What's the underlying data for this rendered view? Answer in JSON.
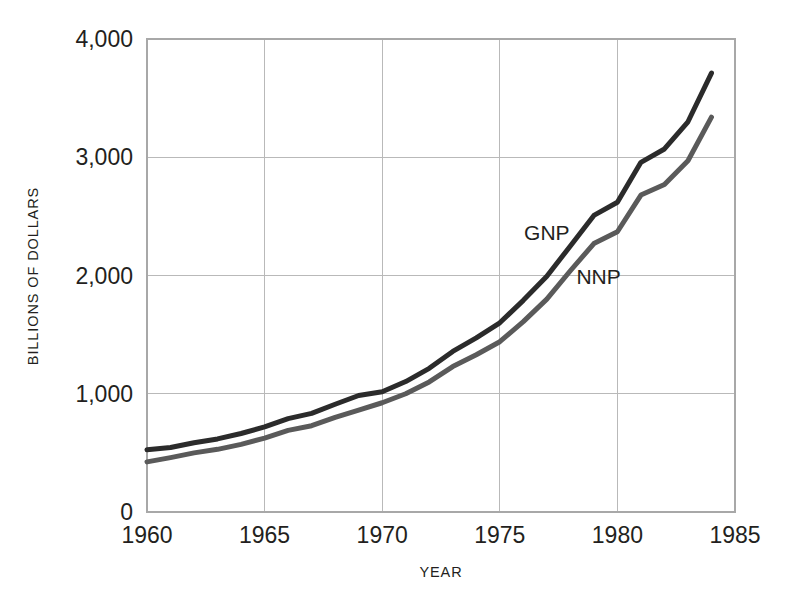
{
  "chart_data": {
    "type": "line",
    "title": "",
    "xlabel": "YEAR",
    "ylabel": "BILLIONS OF DOLLARS",
    "xlim": [
      1960,
      1985
    ],
    "ylim": [
      0,
      4000
    ],
    "xticks": [
      1960,
      1965,
      1970,
      1975,
      1980,
      1985
    ],
    "xtick_labels": [
      "1960",
      "1965",
      "1970",
      "1975",
      "1980",
      "1985"
    ],
    "yticks": [
      0,
      1000,
      2000,
      3000,
      4000
    ],
    "ytick_labels": [
      "0",
      "1,000",
      "2,000",
      "3,000",
      "4,000"
    ],
    "grid": true,
    "legend_position": "inline-annotation",
    "x": [
      1960,
      1961,
      1962,
      1963,
      1964,
      1965,
      1966,
      1967,
      1968,
      1969,
      1970,
      1971,
      1972,
      1973,
      1974,
      1975,
      1976,
      1977,
      1978,
      1979,
      1980,
      1981,
      1982,
      1983,
      1984
    ],
    "series": [
      {
        "name": "GNP",
        "color": "#2b2b2b",
        "line_width": 5,
        "label_x": 1977.0,
        "label_y": 2300,
        "values": [
          527,
          545,
          586,
          618,
          664,
          720,
          790,
          834,
          911,
          985,
          1017,
          1103,
          1215,
          1358,
          1473,
          1600,
          1790,
          1993,
          2250,
          2508,
          2619,
          2957,
          3070,
          3300,
          3712
        ]
      },
      {
        "name": "NNP",
        "color": "#5a5a5a",
        "line_width": 5,
        "label_x": 1979.2,
        "label_y": 1930,
        "values": [
          424,
          460,
          500,
          530,
          572,
          625,
          690,
          730,
          800,
          862,
          924,
          1000,
          1100,
          1230,
          1330,
          1440,
          1610,
          1800,
          2040,
          2270,
          2370,
          2680,
          2770,
          2970,
          3339
        ]
      }
    ],
    "annotations": [
      {
        "text": "GNP",
        "series": "GNP"
      },
      {
        "text": "NNP",
        "series": "NNP"
      }
    ]
  },
  "colors": {
    "background": "#ffffff",
    "text": "#231f20",
    "grid": "#b9b9b9",
    "frame": "#a8a8a8",
    "gnp_line": "#2b2b2b",
    "nnp_line": "#5a5a5a"
  }
}
